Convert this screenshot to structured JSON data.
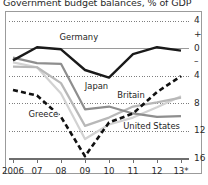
{
  "chart_data": {
    "type": "line",
    "title": "Government budget balances, % of GDP",
    "xlabel": "",
    "ylabel": "",
    "x": [
      2006,
      2007,
      2008,
      2009,
      2010,
      2011,
      2012,
      2013
    ],
    "xtick_labels": [
      "2006",
      "07",
      "08",
      "09",
      "10",
      "11",
      "12",
      "13*"
    ],
    "ytick_labels": [
      "4",
      "+",
      "0",
      "–",
      "4",
      "8",
      "12",
      "16"
    ],
    "ytick_values": [
      4,
      2,
      0,
      -2,
      -4,
      -8,
      -12,
      -16
    ],
    "ylim": [
      -16,
      4
    ],
    "grid": "horizontal dotted, solid zero line",
    "legend": "inline series labels",
    "footnote": "* forecast",
    "series": [
      {
        "name": "Germany",
        "style": "solid",
        "color": "#1a1a1a",
        "width": 2.4,
        "values": [
          -1.7,
          0.2,
          -0.1,
          -3.1,
          -4.2,
          -0.8,
          0.2,
          -0.3
        ],
        "label_x": 2007.9,
        "label_y": 1.5
      },
      {
        "name": "Japan",
        "style": "solid",
        "color": "#8e8e8e",
        "width": 2.2,
        "values": [
          -1.3,
          -2.1,
          -2.2,
          -8.8,
          -8.4,
          -9.4,
          -9.9,
          -9.8
        ],
        "label_x": 2008.95,
        "label_y": -5.6
      },
      {
        "name": "Britain",
        "style": "solid",
        "color": "#b8b8b8",
        "width": 2.2,
        "values": [
          -2.6,
          -2.7,
          -5.0,
          -11.2,
          -10.0,
          -8.4,
          -7.8,
          -7.1
        ],
        "label_x": 2010.3,
        "label_y": -6.9
      },
      {
        "name": "United States",
        "style": "solid",
        "color": "#d2d2d2",
        "width": 2.2,
        "values": [
          -2.0,
          -2.7,
          -6.5,
          -13.1,
          -11.0,
          -10.0,
          -8.5,
          -6.9
        ],
        "label_x": 2010.55,
        "label_y": -11.4
      },
      {
        "name": "Greece",
        "style": "dashed",
        "color": "#111111",
        "width": 2.6,
        "values": [
          -6.0,
          -6.8,
          -9.9,
          -15.6,
          -10.7,
          -9.4,
          -6.3,
          -4.0
        ],
        "label_x": 2006.6,
        "label_y": -9.6
      }
    ]
  }
}
